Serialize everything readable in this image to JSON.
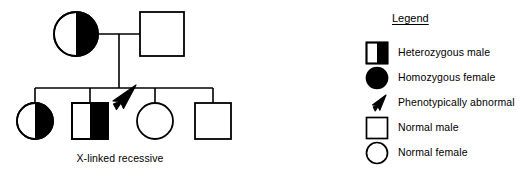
{
  "figure": {
    "caption": "X-linked recessive"
  },
  "pedigree": {
    "generation1": [
      {
        "id": "mother",
        "shape": "circle",
        "fill": "half-right",
        "label": "Heterozygous female"
      },
      {
        "id": "father",
        "shape": "square",
        "fill": "open",
        "label": "Normal male"
      }
    ],
    "generation2": [
      {
        "id": "daughter-1",
        "shape": "circle",
        "fill": "half-right",
        "label": "Heterozygous female"
      },
      {
        "id": "son-1",
        "shape": "square",
        "fill": "half-right",
        "label": "Affected male",
        "proband": "true"
      },
      {
        "id": "daughter-2",
        "shape": "circle",
        "fill": "open",
        "label": "Normal female"
      },
      {
        "id": "son-2",
        "shape": "square",
        "fill": "open",
        "label": "Normal male"
      }
    ],
    "arrow": {
      "name": "proband-arrow",
      "points_to": "son-1",
      "direction": "down-left"
    }
  },
  "legend": {
    "title": "Legend",
    "items": [
      {
        "symbol": "square-half-filled",
        "label": "Heterozygous male"
      },
      {
        "symbol": "circle-filled",
        "label": "Homozygous female"
      },
      {
        "symbol": "arrow",
        "label": "Phenotypically abnormal"
      },
      {
        "symbol": "square-open",
        "label": "Normal male"
      },
      {
        "symbol": "circle-open",
        "label": "Normal female"
      }
    ]
  },
  "colors": {
    "ink": "#000000",
    "background": "#ffffff",
    "fill": "#000000"
  }
}
